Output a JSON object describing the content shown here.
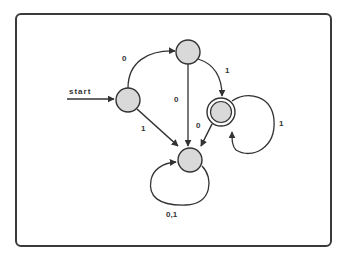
{
  "diagram": {
    "type": "finite-automaton",
    "colors": {
      "node_fill": "#d9d9d9",
      "stroke": "#333333",
      "frame": "#3a3a3a"
    },
    "start_label": "start",
    "states": [
      {
        "id": "q0",
        "role": "start",
        "cx": 128,
        "cy": 100
      },
      {
        "id": "q1",
        "role": "normal",
        "cx": 188,
        "cy": 52
      },
      {
        "id": "q2",
        "role": "accept",
        "cx": 221,
        "cy": 112
      },
      {
        "id": "q3",
        "role": "sink",
        "cx": 190,
        "cy": 160
      }
    ],
    "transitions": [
      {
        "from": "q0",
        "to": "q1",
        "label": "0"
      },
      {
        "from": "q0",
        "to": "q3",
        "label": "1"
      },
      {
        "from": "q1",
        "to": "q2",
        "label": "1"
      },
      {
        "from": "q1",
        "to": "q3",
        "label": "0"
      },
      {
        "from": "q2",
        "to": "q3",
        "label": "0"
      },
      {
        "from": "q2",
        "to": "q2",
        "label": "1"
      },
      {
        "from": "q3",
        "to": "q3",
        "label": "0,1"
      }
    ],
    "labels": {
      "t_q0_q1": "0",
      "t_q0_q3": "1",
      "t_q1_q2": "1",
      "t_q1_q3": "0",
      "t_q2_q3": "0",
      "t_q2_q2": "1",
      "t_q3_q3": "0,1"
    }
  }
}
